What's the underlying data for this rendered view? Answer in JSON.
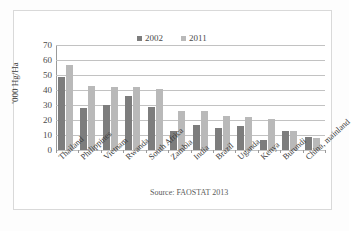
{
  "chart_data": {
    "type": "bar",
    "title": "",
    "xlabel": "",
    "ylabel": "'000 Hg/Ha",
    "ylim": [
      0,
      70
    ],
    "yticks": [
      0,
      10,
      20,
      30,
      40,
      50,
      60,
      70
    ],
    "grid": true,
    "legend_position": "top-center",
    "categories": [
      "Thailand",
      "Philippines",
      "Vietnam",
      "Rwanda",
      "South Africa",
      "Zambia",
      "India",
      "Brazil",
      "Uganda",
      "Kenya",
      "Burundi",
      "China, mainland"
    ],
    "series": [
      {
        "name": "2002",
        "color": "#7d7d7d",
        "values": [
          49,
          28,
          30,
          36,
          29,
          13,
          17,
          15,
          16,
          7,
          13,
          9
        ]
      },
      {
        "name": "2011",
        "color": "#b9b9b9",
        "values": [
          57,
          43,
          42,
          42,
          41,
          26,
          26,
          23,
          22,
          21,
          13,
          8
        ]
      }
    ],
    "annotations": [
      "Source: FAOSTAT 2013"
    ]
  },
  "source_note": "Source: FAOSTAT 2013",
  "colors": {
    "series_2002": "#7d7d7d",
    "series_2011": "#b9b9b9",
    "gridline": "#c2c2c2",
    "axis": "#9a9a9a",
    "frame": "#d9d9d9",
    "background": "#ffffff"
  }
}
